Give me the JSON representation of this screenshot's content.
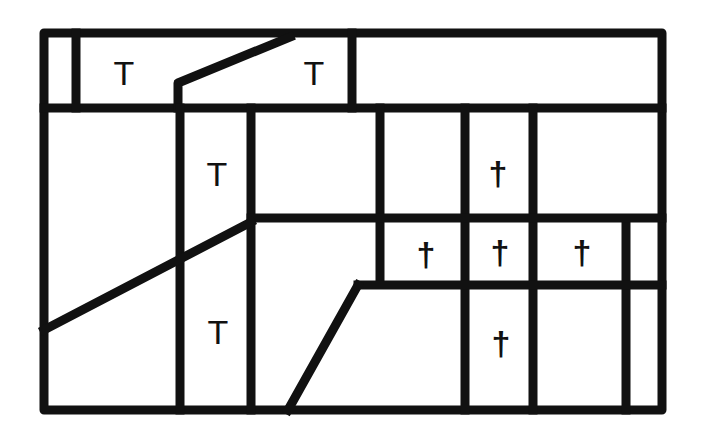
{
  "diagram": {
    "stroke_color": "#111111",
    "background": "#ffffff",
    "stroke_width": 9,
    "outer_frame": {
      "x1": 44,
      "y1": 33,
      "x2": 662,
      "y2": 410
    },
    "lines": [
      {
        "id": "top-band-bottom",
        "points": [
          [
            44,
            108
          ],
          [
            662,
            108
          ]
        ]
      },
      {
        "id": "top-left-divider",
        "points": [
          [
            76,
            33
          ],
          [
            76,
            108
          ]
        ]
      },
      {
        "id": "top-mid-divider",
        "points": [
          [
            352,
            33
          ],
          [
            352,
            108
          ]
        ]
      },
      {
        "id": "top-diagonal",
        "points": [
          [
            178,
            108
          ],
          [
            178,
            83
          ],
          [
            290,
            37
          ]
        ]
      },
      {
        "id": "col-a",
        "points": [
          [
            180,
            108
          ],
          [
            180,
            410
          ]
        ]
      },
      {
        "id": "col-b",
        "points": [
          [
            251,
            108
          ],
          [
            251,
            410
          ]
        ]
      },
      {
        "id": "col-c",
        "points": [
          [
            380,
            108
          ],
          [
            380,
            284
          ]
        ]
      },
      {
        "id": "col-d",
        "points": [
          [
            465,
            108
          ],
          [
            465,
            410
          ]
        ]
      },
      {
        "id": "col-e",
        "points": [
          [
            533,
            108
          ],
          [
            533,
            410
          ]
        ]
      },
      {
        "id": "col-f",
        "points": [
          [
            626,
            219
          ],
          [
            626,
            410
          ]
        ]
      },
      {
        "id": "mid-horizontal",
        "points": [
          [
            251,
            218
          ],
          [
            662,
            218
          ]
        ]
      },
      {
        "id": "low-horizontal",
        "points": [
          [
            358,
            285
          ],
          [
            662,
            285
          ]
        ]
      },
      {
        "id": "left-diagonal",
        "points": [
          [
            44,
            330
          ],
          [
            251,
            222
          ]
        ]
      },
      {
        "id": "bottom-slant",
        "points": [
          [
            288,
            410
          ],
          [
            358,
            285
          ]
        ]
      }
    ],
    "labels": [
      {
        "id": "T-1",
        "text": "T",
        "x": 124,
        "y": 73,
        "kind": "T"
      },
      {
        "id": "T-2",
        "text": "T",
        "x": 314,
        "y": 73,
        "kind": "T"
      },
      {
        "id": "T-3",
        "text": "T",
        "x": 217,
        "y": 174,
        "kind": "T"
      },
      {
        "id": "T-4",
        "text": "T",
        "x": 218,
        "y": 332,
        "kind": "T"
      },
      {
        "id": "dagger-1",
        "text": "†",
        "x": 498,
        "y": 173,
        "kind": "dagger"
      },
      {
        "id": "dagger-2",
        "text": "†",
        "x": 426,
        "y": 254,
        "kind": "dagger"
      },
      {
        "id": "dagger-3",
        "text": "†",
        "x": 500,
        "y": 252,
        "kind": "dagger"
      },
      {
        "id": "dagger-4",
        "text": "†",
        "x": 582,
        "y": 252,
        "kind": "dagger"
      },
      {
        "id": "dagger-5",
        "text": "†",
        "x": 501,
        "y": 343,
        "kind": "dagger"
      }
    ]
  }
}
